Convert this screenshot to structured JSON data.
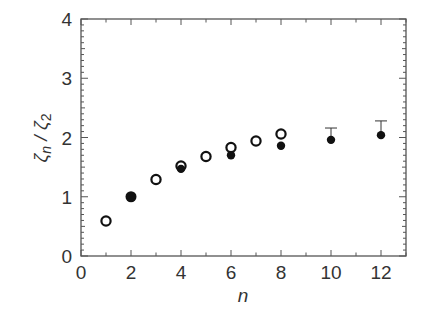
{
  "chart_data": {
    "type": "scatter",
    "title": "",
    "xlabel": "n",
    "ylabel": "ζn / ζ2",
    "xlim": [
      0,
      13
    ],
    "ylim": [
      0,
      4
    ],
    "grid": false,
    "legend": null,
    "x_ticks": [
      0,
      2,
      4,
      6,
      8,
      10,
      12
    ],
    "x_tick_labels": [
      "0",
      "2",
      "4",
      "6",
      "8",
      "10",
      "12"
    ],
    "y_ticks": [
      0,
      1,
      2,
      3,
      4
    ],
    "y_tick_labels": [
      "0",
      "1",
      "2",
      "3",
      "4"
    ],
    "series": [
      {
        "name": "open circles",
        "marker": "open-circle",
        "x": [
          1,
          3,
          4,
          5,
          6,
          7,
          8
        ],
        "y": [
          0.59,
          1.29,
          1.52,
          1.68,
          1.83,
          1.94,
          2.06
        ]
      },
      {
        "name": "filled circles",
        "marker": "filled-circle",
        "x": [
          2,
          4,
          6,
          8,
          10,
          12
        ],
        "y": [
          1.0,
          1.47,
          1.7,
          1.86,
          1.96,
          2.04
        ],
        "error_upper": [
          0,
          0.04,
          0.04,
          0.04,
          0.2,
          0.24
        ]
      }
    ]
  }
}
